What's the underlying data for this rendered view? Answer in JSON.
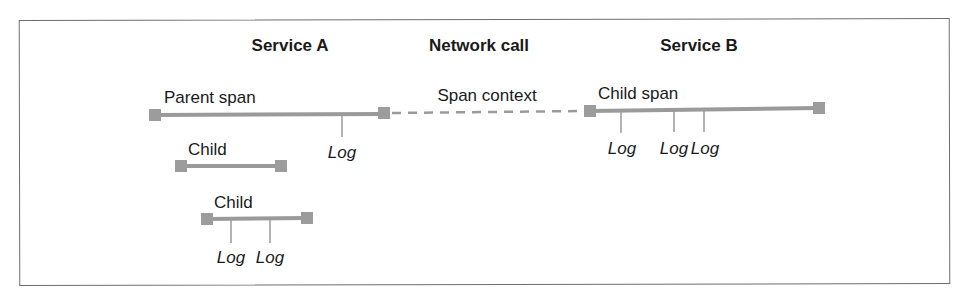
{
  "diagram": {
    "columns": [
      {
        "id": "service_a",
        "title": "Service A"
      },
      {
        "id": "network",
        "title": "Network call"
      },
      {
        "id": "service_b",
        "title": "Service B"
      }
    ],
    "spans": [
      {
        "id": "parent",
        "label": "Parent span",
        "service": "Service A",
        "logs": [
          "Log"
        ]
      },
      {
        "id": "child1",
        "label": "Child",
        "service": "Service A",
        "logs": []
      },
      {
        "id": "child2",
        "label": "Child",
        "service": "Service A",
        "logs": [
          "Log",
          "Log"
        ]
      },
      {
        "id": "child_span_b",
        "label": "Child span",
        "service": "Service B",
        "logs": [
          "Log",
          "Log",
          "Log"
        ]
      }
    ],
    "connection": {
      "label": "Span context",
      "from": "parent",
      "to": "child_span_b",
      "style": "dashed"
    },
    "colors": {
      "bar": "#9a9a9a",
      "text": "#1a1a1a",
      "frame": "#6e6e6e"
    }
  }
}
